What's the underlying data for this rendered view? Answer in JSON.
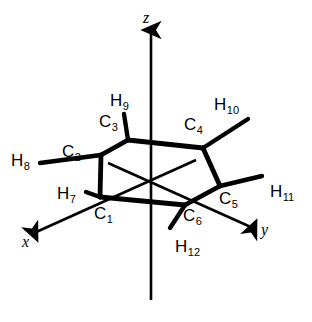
{
  "figure": {
    "background_color": "#ffffff",
    "stroke_color": "#000000",
    "width": 312,
    "height": 322
  },
  "axes": [
    {
      "name": "z",
      "label": "z",
      "label_x": 143,
      "label_y": 10,
      "x1": 151,
      "y1": 300,
      "x2": 151,
      "y2": 30
    },
    {
      "name": "x",
      "label": "x",
      "label_x": 22,
      "label_y": 234,
      "x1": 196,
      "y1": 160,
      "x2": 34,
      "y2": 233
    },
    {
      "name": "y",
      "label": "y",
      "label_x": 261,
      "label_y": 222,
      "x1": 108,
      "y1": 163,
      "x2": 253,
      "y2": 228
    }
  ],
  "carbons": [
    {
      "id": "C1",
      "element": "C",
      "index": "1",
      "vx": 100,
      "vy": 197,
      "label_x": 94,
      "label_y": 205
    },
    {
      "id": "C2",
      "element": "C",
      "index": "2",
      "vx": 101,
      "vy": 155,
      "label_x": 62,
      "label_y": 143
    },
    {
      "id": "C3",
      "element": "C",
      "index": "3",
      "vx": 128,
      "vy": 140,
      "label_x": 99,
      "label_y": 113
    },
    {
      "id": "C4",
      "element": "C",
      "index": "4",
      "vx": 203,
      "vy": 148,
      "label_x": 184,
      "label_y": 116
    },
    {
      "id": "C5",
      "element": "C",
      "index": "5",
      "vx": 220,
      "vy": 186,
      "label_x": 219,
      "label_y": 190
    },
    {
      "id": "C6",
      "element": "C",
      "index": "6",
      "vx": 185,
      "vy": 205,
      "label_x": 183,
      "label_y": 207
    }
  ],
  "hydrogens": [
    {
      "id": "H7",
      "element": "H",
      "index": "7",
      "label_x": 57,
      "label_y": 185,
      "bond_from": "C1",
      "bx": 86,
      "by": 192
    },
    {
      "id": "H8",
      "element": "H",
      "index": "8",
      "label_x": 11,
      "label_y": 152,
      "bond_from": "C2",
      "bx": 40,
      "by": 163
    },
    {
      "id": "H9",
      "element": "H",
      "index": "9",
      "label_x": 110,
      "label_y": 92,
      "bond_from": "C3",
      "bx": 124,
      "by": 114
    },
    {
      "id": "H10",
      "element": "H",
      "index": "10",
      "label_x": 214,
      "label_y": 96,
      "bond_from": "C4",
      "bx": 248,
      "by": 119
    },
    {
      "id": "H11",
      "element": "H",
      "index": "11",
      "label_x": 270,
      "label_y": 183,
      "bond_from": "C5",
      "bx": 262,
      "by": 176
    },
    {
      "id": "H12",
      "element": "H",
      "index": "12",
      "label_x": 175,
      "label_y": 238,
      "bond_from": "C6",
      "bx": 170,
      "by": 228
    }
  ],
  "ring_bonds": [
    {
      "from": "C1",
      "to": "C2"
    },
    {
      "from": "C2",
      "to": "C3"
    },
    {
      "from": "C3",
      "to": "C4"
    },
    {
      "from": "C4",
      "to": "C5"
    },
    {
      "from": "C5",
      "to": "C6"
    },
    {
      "from": "C6",
      "to": "C1"
    }
  ],
  "chart_data": {
    "type": "diagram",
    "subtype": "molecular-structure",
    "molecule": "cyclohexane",
    "atoms": [
      {
        "label": "C1",
        "x": 100,
        "y": 197
      },
      {
        "label": "C2",
        "x": 101,
        "y": 155
      },
      {
        "label": "C3",
        "x": 128,
        "y": 140
      },
      {
        "label": "C4",
        "x": 203,
        "y": 148
      },
      {
        "label": "C5",
        "x": 220,
        "y": 186
      },
      {
        "label": "C6",
        "x": 185,
        "y": 205
      },
      {
        "label": "H7",
        "x": 57,
        "y": 185
      },
      {
        "label": "H8",
        "x": 11,
        "y": 152
      },
      {
        "label": "H9",
        "x": 110,
        "y": 92
      },
      {
        "label": "H10",
        "x": 214,
        "y": 96
      },
      {
        "label": "H11",
        "x": 270,
        "y": 183
      },
      {
        "label": "H12",
        "x": 175,
        "y": 238
      }
    ],
    "bonds": [
      [
        "C1",
        "C2"
      ],
      [
        "C2",
        "C3"
      ],
      [
        "C3",
        "C4"
      ],
      [
        "C4",
        "C5"
      ],
      [
        "C5",
        "C6"
      ],
      [
        "C6",
        "C1"
      ],
      [
        "C1",
        "H7"
      ],
      [
        "C2",
        "H8"
      ],
      [
        "C3",
        "H9"
      ],
      [
        "C4",
        "H10"
      ],
      [
        "C5",
        "H11"
      ],
      [
        "C6",
        "H12"
      ]
    ],
    "axis_labels": [
      "x",
      "y",
      "z"
    ],
    "legend": [],
    "grid": false
  }
}
